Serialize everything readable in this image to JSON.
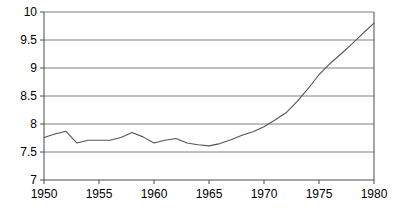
{
  "chart_data": {
    "type": "line",
    "title": "",
    "subtitle": "",
    "xlabel": "",
    "ylabel": "",
    "xlim": [
      1950,
      1980
    ],
    "ylim": [
      7,
      10
    ],
    "grid": true,
    "grid_axis": "y",
    "legend": false,
    "legend_position": "none",
    "xticks": [
      1950,
      1955,
      1960,
      1965,
      1970,
      1975,
      1980
    ],
    "xtick_labels": [
      "1950",
      "1955",
      "1960",
      "1965",
      "1970",
      "1975",
      "1980"
    ],
    "yticks": [
      7,
      7.5,
      8,
      8.5,
      9,
      9.5,
      10
    ],
    "ytick_labels": [
      "7",
      "7.5",
      "8",
      "8.5",
      "9",
      "9.5",
      "10"
    ],
    "x": [
      1950,
      1951,
      1952,
      1953,
      1954,
      1955,
      1956,
      1957,
      1958,
      1959,
      1960,
      1961,
      1962,
      1963,
      1964,
      1965,
      1966,
      1967,
      1968,
      1969,
      1970,
      1971,
      1972,
      1973,
      1974,
      1975,
      1976,
      1977,
      1978,
      1979,
      1980
    ],
    "values": [
      7.76,
      7.82,
      7.87,
      7.66,
      7.71,
      7.71,
      7.71,
      7.76,
      7.85,
      7.77,
      7.66,
      7.71,
      7.74,
      7.66,
      7.63,
      7.61,
      7.65,
      7.72,
      7.8,
      7.86,
      7.95,
      8.07,
      8.2,
      8.4,
      8.63,
      8.88,
      9.08,
      9.25,
      9.43,
      9.62,
      9.8
    ],
    "series": [
      {
        "name": "series-1",
        "color": "#555555",
        "values": [
          7.76,
          7.82,
          7.87,
          7.66,
          7.71,
          7.71,
          7.71,
          7.76,
          7.85,
          7.77,
          7.66,
          7.71,
          7.74,
          7.66,
          7.63,
          7.61,
          7.65,
          7.72,
          7.8,
          7.86,
          7.95,
          8.07,
          8.2,
          8.4,
          8.63,
          8.88,
          9.08,
          9.25,
          9.43,
          9.62,
          9.8
        ]
      }
    ]
  },
  "style": {
    "background": "#ffffff",
    "axis_color": "#4d4d4d",
    "grid_color": "#808080",
    "line_color": "#555555",
    "text_color": "#000000"
  }
}
